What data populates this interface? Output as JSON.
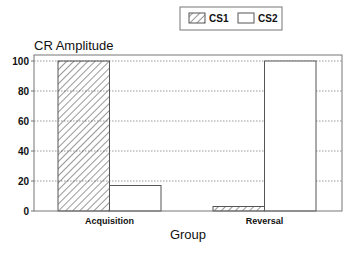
{
  "chart_data": {
    "type": "bar",
    "title": "",
    "ylabel": "CR Amplitude",
    "xlabel": "Group",
    "categories": [
      "Acquisition",
      "Reversal"
    ],
    "series": [
      {
        "name": "CS1",
        "values": [
          100,
          3
        ],
        "fill": "hatched"
      },
      {
        "name": "CS2",
        "values": [
          17,
          100
        ],
        "fill": "white"
      }
    ],
    "ylim": [
      0,
      100
    ],
    "yticks": [
      0,
      20,
      40,
      60,
      80,
      100
    ],
    "grid": "horizontal dotted",
    "legend_position": "top center"
  },
  "legend": {
    "items": [
      "CS1",
      "CS2"
    ]
  },
  "colors": {
    "line": "#333333",
    "grid": "#999999",
    "background": "#ffffff"
  }
}
